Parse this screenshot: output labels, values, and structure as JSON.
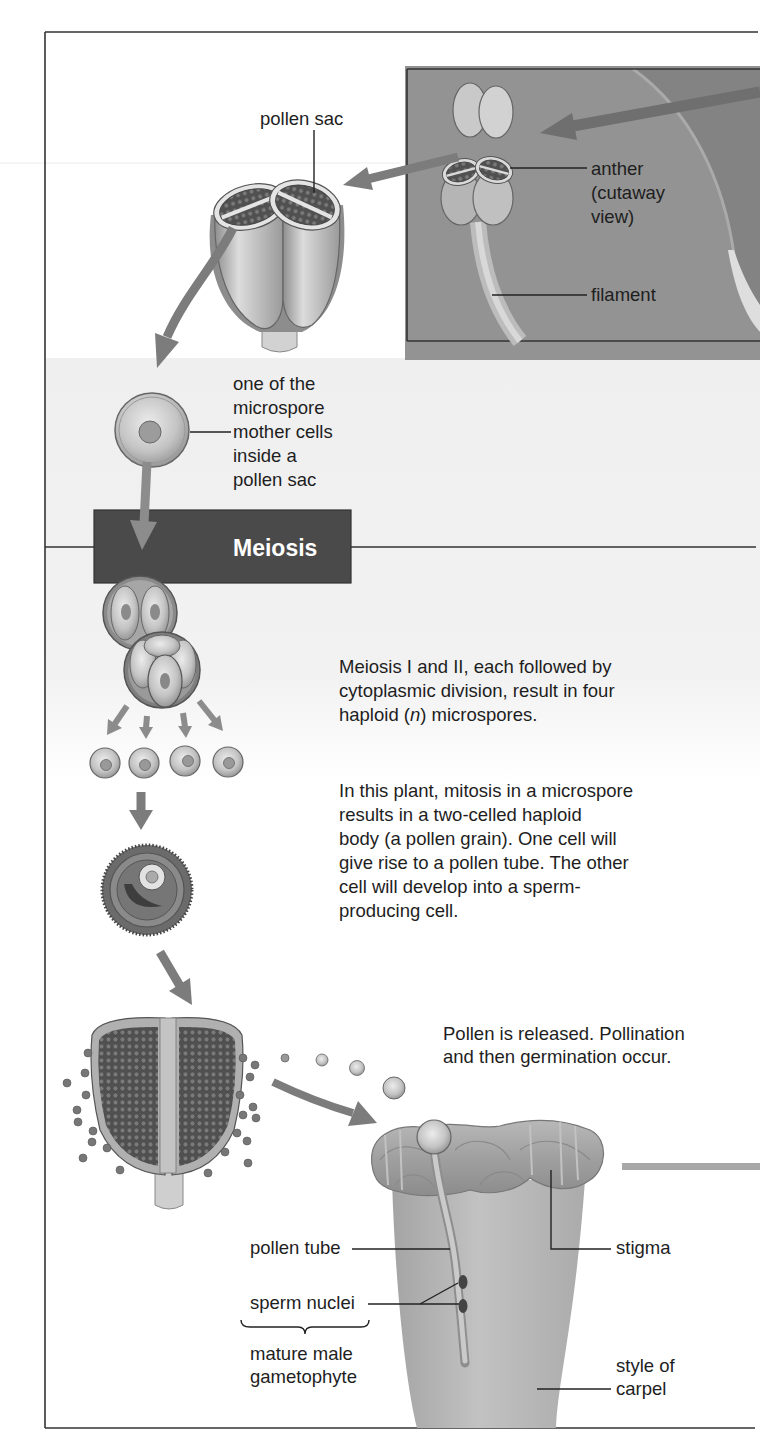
{
  "figure": {
    "labels": {
      "pollen_sac": "pollen sac",
      "anther": [
        "anther",
        "(cutaway",
        "view)"
      ],
      "filament": "filament",
      "microspore_mother_cell": [
        "one of the",
        "microspore",
        "mother cells",
        "inside a",
        "pollen sac"
      ],
      "meiosis": "Meiosis",
      "pollen_tube": "pollen tube",
      "sperm_nuclei": "sperm nuclei",
      "mature_male_gametophyte": [
        "mature male",
        "gametophyte"
      ],
      "stigma": "stigma",
      "style_of_carpel": [
        "style of",
        "carpel"
      ]
    },
    "captions": {
      "meiosis_result": {
        "line1": "Meiosis I and II, each followed by",
        "line2": "cytoplasmic division, result in four",
        "line3_pre": "haploid (",
        "line3_italic": "n",
        "line3_post": ") microspores."
      },
      "mitosis": [
        "In this plant, mitosis in a microspore",
        "results in a two-celled haploid",
        "body (a pollen grain). One cell will",
        "give rise to a pollen tube. The other",
        "cell will develop into a sperm-",
        "producing cell."
      ],
      "pollination": [
        "Pollen is released. Pollination",
        "and then germination occur."
      ]
    },
    "colors": {
      "frame_line": "#333333",
      "inset_background": "#8f8f8f",
      "meiosis_box": "#4a4a4a",
      "arrow": "#7c7c7c",
      "text": "#1e1e1e"
    }
  }
}
